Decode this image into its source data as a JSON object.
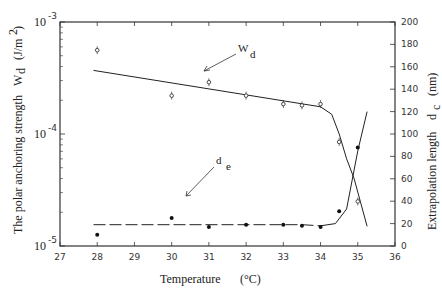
{
  "chart_data": {
    "type": "scatter",
    "title": "",
    "xlabel": "Temperature (°C)",
    "ylabel_left": "The polar anchoring strength W_d (J/m²)",
    "ylabel_right": "Extrapolation length d_c (nm)",
    "xlim": [
      27,
      36
    ],
    "ylim_left": [
      1e-05,
      0.001
    ],
    "ylim_left_scale": "log",
    "ylim_right": [
      0,
      200
    ],
    "x_ticks": [
      "27",
      "28",
      "29",
      "30",
      "31",
      "32",
      "33",
      "34",
      "35",
      "36"
    ],
    "y_left_ticks": [
      "10^-5",
      "10^-4",
      "10^-3"
    ],
    "y_right_ticks": [
      "0",
      "20",
      "40",
      "60",
      "80",
      "100",
      "120",
      "140",
      "160",
      "180",
      "200"
    ],
    "grid": false,
    "series": [
      {
        "name": "W_d",
        "axis": "left",
        "marker": "open-circle",
        "x": [
          28,
          30,
          31,
          32,
          33,
          33.5,
          34,
          34.5,
          35
        ],
        "values": [
          0.00056,
          0.00022,
          0.00029,
          0.00022,
          0.000185,
          0.00018,
          0.000185,
          8.5e-05,
          2.5e-05
        ],
        "fit_line": {
          "x": [
            27.9,
            34,
            34.3,
            34.5,
            34.7,
            34.9,
            35.25
          ],
          "values": [
            0.00037,
            0.000175,
            0.00015,
            0.0001,
            6e-05,
            4e-05,
            1.5e-05
          ]
        }
      },
      {
        "name": "d_e",
        "axis": "right",
        "marker": "filled-circle",
        "x": [
          28,
          30,
          31,
          32,
          33,
          33.5,
          34,
          34.5,
          35
        ],
        "values": [
          10,
          25,
          17,
          19,
          19,
          18,
          17,
          31,
          88
        ],
        "fit_line": {
          "x": [
            27.9,
            33.5,
            34,
            34.4,
            34.7,
            35.0,
            35.25
          ],
          "values": [
            19,
            19,
            18,
            20,
            33,
            85,
            120
          ]
        }
      }
    ],
    "annotations": [
      {
        "text": "W",
        "sub": "d",
        "x": 32.6,
        "y_px": 48
      },
      {
        "text": "d",
        "sub": "e",
        "x": 32.5,
        "y_px": 160
      }
    ]
  },
  "labels": {
    "x_title": "Temperature",
    "x_unit": "(°C)",
    "left_title": "The polar anchoring strength",
    "left_sym": "W",
    "left_sub": "d",
    "left_unit": "(J/m",
    "left_unit_sup": "2",
    "left_unit_close": ")",
    "right_title": "Extrapolation length",
    "right_sym": "d",
    "right_sub": "c",
    "right_unit": "(nm)",
    "annot_wd": "W",
    "annot_wd_sub": "d",
    "annot_de": "d",
    "annot_de_sub": "e"
  }
}
